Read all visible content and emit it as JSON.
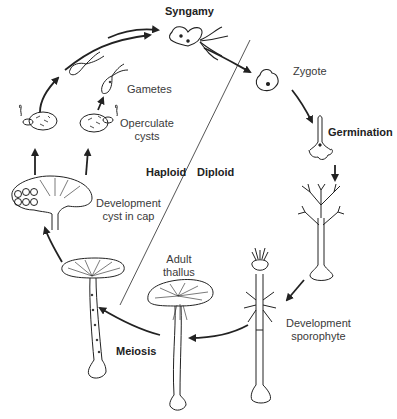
{
  "diagram": {
    "labels": {
      "syngamy": "Syngamy",
      "zygote": "Zygote",
      "germination": "Germination",
      "development_sporophyte_line1": "Development",
      "development_sporophyte_line2": "sporophyte",
      "adult_thallus_line1": "Adult",
      "adult_thallus_line2": "thallus",
      "meiosis": "Meiosis",
      "development_cyst_line1": "Development",
      "development_cyst_line2": "cyst in cap",
      "operculate_cysts_line1": "Operculate",
      "operculate_cysts_line2": "cysts",
      "gametes": "Gametes",
      "haploid": "Haploid",
      "diploid": "Diploid"
    },
    "stages": [
      "Syngamy",
      "Zygote",
      "Germination",
      "Development sporophyte",
      "Adult thallus",
      "Meiosis",
      "Development cyst in cap",
      "Operculate cysts",
      "Gametes"
    ],
    "phases": [
      "Haploid",
      "Diploid"
    ]
  }
}
